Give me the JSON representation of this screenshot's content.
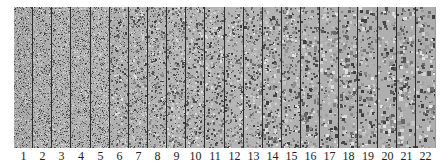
{
  "figure": {
    "panel_count": 22,
    "labels": [
      "1",
      "2",
      "3",
      "4",
      "5",
      "6",
      "7",
      "8",
      "9",
      "10",
      "11",
      "12",
      "13",
      "14",
      "15",
      "16",
      "17",
      "18",
      "19",
      "20",
      "21",
      "22"
    ],
    "panel_tones": [
      "#a9a9a9",
      "#afafaf",
      "#b3b3b3",
      "#b1b1b1",
      "#b4b4b4",
      "#b0b0b0",
      "#b2b2b2",
      "#b3b3b3",
      "#b5b5b5",
      "#b4b4b4",
      "#b3b3b3",
      "#b5b5b5",
      "#b4b4b4",
      "#b3b3b3",
      "#b2b2b2",
      "#b1b1b1",
      "#b0b0b0",
      "#afafaf",
      "#b0b0b0",
      "#afafaf",
      "#adadad",
      "#aeaeae"
    ],
    "grain_sizes": [
      1,
      1,
      1,
      1,
      1,
      1.2,
      1.2,
      1.3,
      1.4,
      1.5,
      1.6,
      1.7,
      1.8,
      1.9,
      2,
      2.1,
      2.2,
      2.3,
      2.4,
      2.5,
      2.6,
      2.7
    ],
    "divider_color": "#2c2c2c"
  }
}
